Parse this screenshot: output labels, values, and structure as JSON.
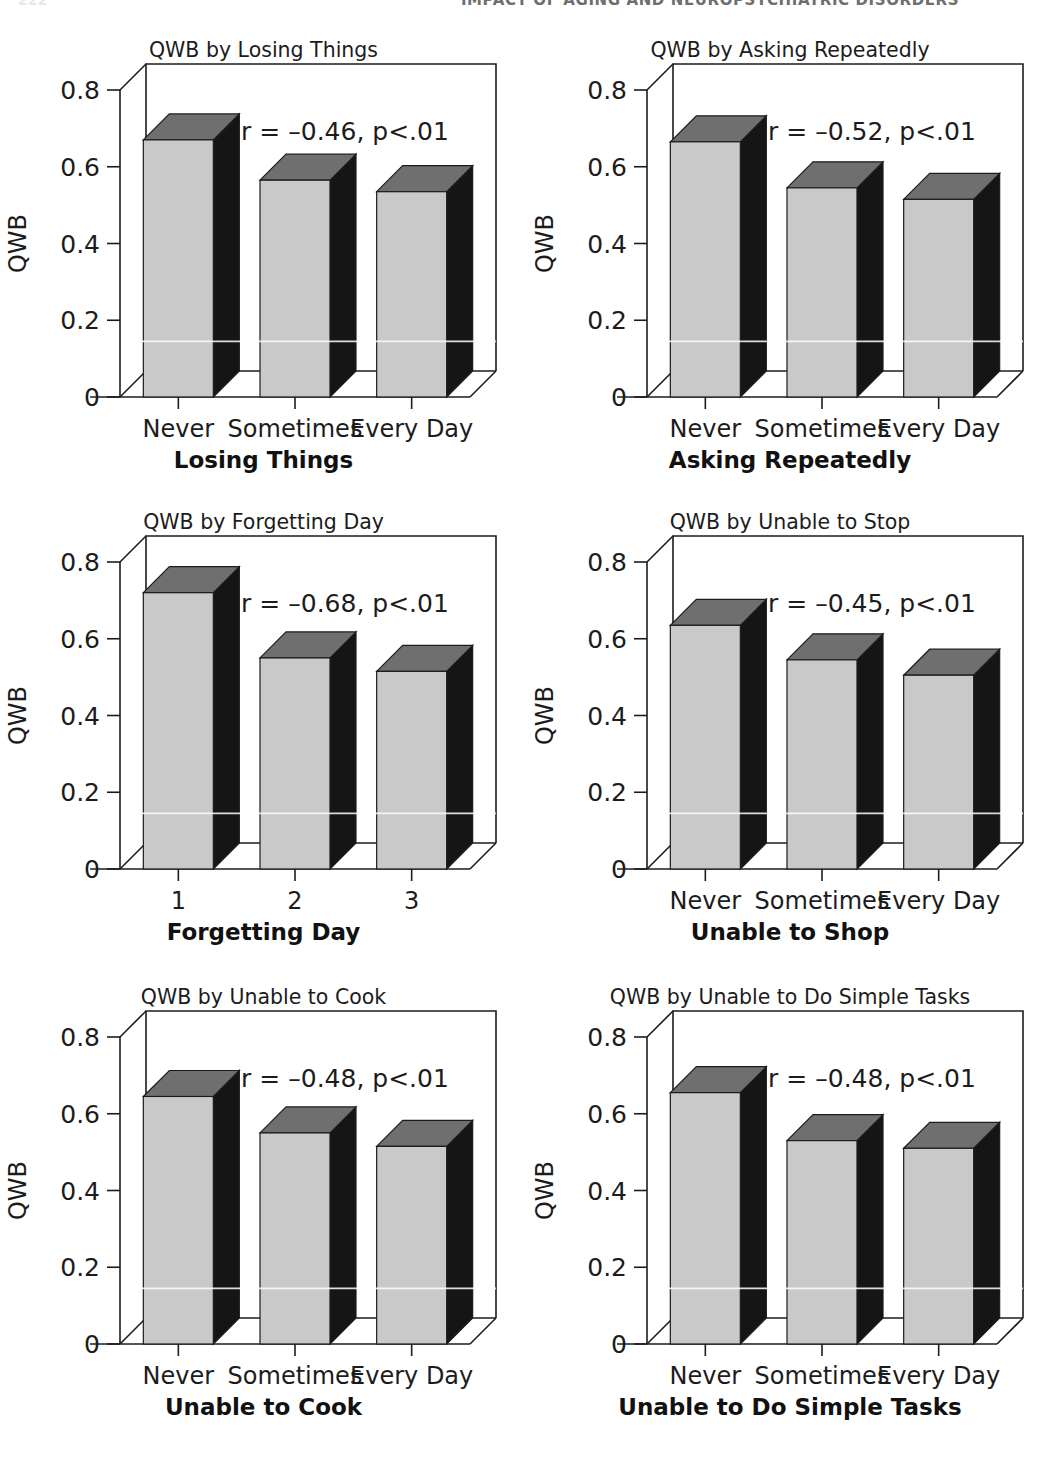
{
  "page": {
    "folio": "222",
    "running_head": "IMPACT OF AGING AND NEUROPSYCHIATRIC DISORDERS"
  },
  "figure": {
    "y_axis_label": "QWB",
    "y_ticks": [
      "0",
      "0.2",
      "0.4",
      "0.6",
      "0.8"
    ],
    "y_tick_values": [
      0,
      0.2,
      0.4,
      0.6,
      0.8
    ],
    "colors": {
      "bar_front": "#c9c9c9",
      "bar_top": "#6f6f6f",
      "bar_side": "#151515",
      "axis": "#1c1c1c",
      "text": "#1c1c1c"
    }
  },
  "chart_data": [
    {
      "id": "losing-things",
      "type": "bar",
      "title": "QWB by Losing Things",
      "xlabel": "Losing Things",
      "ylabel": "QWB",
      "categories": [
        "Never",
        "Sometimes",
        "Every Day"
      ],
      "values": [
        0.67,
        0.565,
        0.535
      ],
      "ylim": [
        0,
        0.8
      ],
      "annotation": "r = –0.46, p<.01",
      "r": -0.46,
      "p": "<.01",
      "grid": false,
      "legend": "none"
    },
    {
      "id": "asking-repeatedly",
      "type": "bar",
      "title": "QWB by Asking Repeatedly",
      "xlabel": "Asking Repeatedly",
      "ylabel": "QWB",
      "categories": [
        "Never",
        "Sometimes",
        "Every Day"
      ],
      "values": [
        0.665,
        0.545,
        0.515
      ],
      "ylim": [
        0,
        0.8
      ],
      "annotation": "r = –0.52, p<.01",
      "r": -0.52,
      "p": "<.01",
      "grid": false,
      "legend": "none"
    },
    {
      "id": "forgetting-day",
      "type": "bar",
      "title": "QWB by Forgetting Day",
      "xlabel": "Forgetting Day",
      "ylabel": "QWB",
      "categories": [
        "1",
        "2",
        "3"
      ],
      "values": [
        0.72,
        0.55,
        0.515
      ],
      "ylim": [
        0,
        0.8
      ],
      "annotation": "r = –0.68, p<.01",
      "r": -0.68,
      "p": "<.01",
      "grid": false,
      "legend": "none"
    },
    {
      "id": "unable-to-stop",
      "type": "bar",
      "title": "QWB by Unable to Stop",
      "xlabel": "Unable to Shop",
      "ylabel": "QWB",
      "categories": [
        "Never",
        "Sometimes",
        "Every Day"
      ],
      "values": [
        0.635,
        0.545,
        0.505
      ],
      "ylim": [
        0,
        0.8
      ],
      "annotation": "r = –0.45, p<.01",
      "r": -0.45,
      "p": "<.01",
      "grid": false,
      "legend": "none"
    },
    {
      "id": "unable-to-cook",
      "type": "bar",
      "title": "QWB by Unable to Cook",
      "xlabel": "Unable to Cook",
      "ylabel": "QWB",
      "categories": [
        "Never",
        "Sometimes",
        "Every Day"
      ],
      "values": [
        0.645,
        0.55,
        0.515
      ],
      "ylim": [
        0,
        0.8
      ],
      "annotation": "r = –0.48, p<.01",
      "r": -0.48,
      "p": "<.01",
      "grid": false,
      "legend": "none"
    },
    {
      "id": "unable-to-do-simple-tasks",
      "type": "bar",
      "title": "QWB by Unable to Do Simple Tasks",
      "xlabel": "Unable to Do Simple Tasks",
      "ylabel": "QWB",
      "categories": [
        "Never",
        "Sometimes",
        "Every Day"
      ],
      "values": [
        0.655,
        0.53,
        0.51
      ],
      "ylim": [
        0,
        0.8
      ],
      "annotation": "r = –0.48, p<.01",
      "r": -0.48,
      "p": "<.01",
      "grid": false,
      "legend": "none"
    }
  ]
}
